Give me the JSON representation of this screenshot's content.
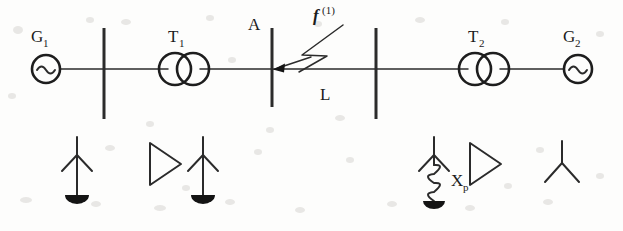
{
  "figure": {
    "kind": "single-line-power-system-diagram",
    "background_color": "#fdfdfc",
    "line_color": "#2b2b2b"
  },
  "labels": {
    "generator_1": "G",
    "generator_1_sub": "1",
    "generator_2": "G",
    "generator_2_sub": "2",
    "transformer_1": "T",
    "transformer_1_sub": "1",
    "transformer_2": "T",
    "transformer_2_sub": "2",
    "bus_a": "A",
    "line": "L",
    "fault": "f",
    "fault_sup": "(1)",
    "reactor": "X",
    "reactor_sub": "p"
  },
  "components": {
    "generators": [
      {
        "name": "G1",
        "label": "G",
        "subscript": "1",
        "symbol": "ac-source-sine",
        "cx": 46,
        "cy": 69,
        "r": 14
      },
      {
        "name": "G2",
        "label": "G",
        "subscript": "2",
        "symbol": "ac-source-sine",
        "cx": 578,
        "cy": 69,
        "r": 14
      }
    ],
    "transformers": [
      {
        "name": "T1",
        "label": "T",
        "subscript": "1",
        "symbol": "two-winding-transformer",
        "cx": 184,
        "cy": 69,
        "r": 16
      },
      {
        "name": "T2",
        "label": "T",
        "subscript": "2",
        "symbol": "two-winding-transformer",
        "cx": 484,
        "cy": 69,
        "r": 16
      }
    ],
    "busbars": [
      {
        "name": "bus-1",
        "x": 104,
        "y1": 28,
        "y2": 119
      },
      {
        "name": "bus-a",
        "x": 272,
        "y1": 28,
        "y2": 107,
        "label": "A"
      },
      {
        "name": "bus-2",
        "x": 376,
        "y1": 28,
        "y2": 119
      }
    ],
    "transmission_line": {
      "name": "L",
      "label": "L",
      "x1": 272,
      "x2": 376,
      "y": 69
    },
    "fault": {
      "name": "single-phase-fault",
      "label": "f",
      "superscript": "(1)",
      "target_x": 272,
      "target_y": 69,
      "symbol": "lightning-arrow"
    },
    "ground_symbols": [
      {
        "name": "grounded-arrester-left",
        "x": 77,
        "top_y": 137,
        "type": "arrow-to-ground"
      },
      {
        "name": "grounded-arrester-mid",
        "x": 203,
        "top_y": 137,
        "type": "arrow-to-ground"
      },
      {
        "name": "grounded-reactor",
        "x": 434,
        "top_y": 137,
        "type": "arrow-reactor-ground",
        "label": "X",
        "subscript": "p"
      }
    ],
    "delta_windings": [
      {
        "name": "delta-winding-left",
        "x": 150,
        "y": 160
      },
      {
        "name": "delta-winding-right",
        "x": 470,
        "y": 160
      }
    ],
    "wye_windings": [
      {
        "name": "wye-winding-right",
        "x": 560,
        "y": 160
      }
    ]
  }
}
